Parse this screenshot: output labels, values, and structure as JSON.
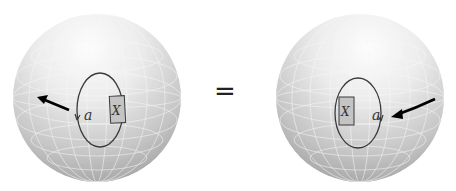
{
  "figure": {
    "left_sphere": {
      "loop_label": "a",
      "box_label": "X",
      "box_side": "right",
      "arrow_direction": "left, pointing outward toward upper-left"
    },
    "relation": "=",
    "right_sphere": {
      "loop_label": "a",
      "box_label": "X",
      "box_side": "left",
      "arrow_direction": "pointing inward toward the loop from the right"
    },
    "colors": {
      "sphere_light": "#fbfbfb",
      "sphere_mid": "#d8d8d8",
      "sphere_dark": "#9a9a9a",
      "grid_line": "#f4f4f4",
      "loop_stroke": "#3a3a3a",
      "box_fill": "#c4c4c4",
      "arrow": "#000000"
    }
  }
}
